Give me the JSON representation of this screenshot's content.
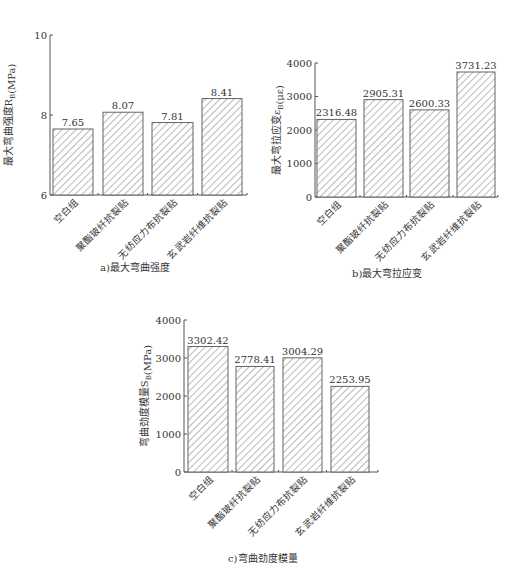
{
  "chart_data": [
    {
      "type": "bar",
      "id": "a",
      "title": "a)最大弯曲强度",
      "ylabel": "最大弯曲强度R_B(MPa)",
      "xlabel": "",
      "categories": [
        "空白组",
        "聚酯玻纤抗裂贴",
        "无纺应力布抗裂贴",
        "玄武岩纤维抗裂贴"
      ],
      "values": [
        7.65,
        8.07,
        7.81,
        8.41
      ],
      "value_labels": [
        "7.65",
        "8.07",
        "7.81",
        "8.41"
      ],
      "ylim": [
        6,
        10
      ],
      "yticks": [
        6,
        8,
        10
      ],
      "grid": false,
      "pattern": "diagonal-hatch"
    },
    {
      "type": "bar",
      "id": "b",
      "title": "b)最大弯拉应变",
      "ylabel": "最大弯拉应变ε_B(με)",
      "xlabel": "",
      "categories": [
        "空白组",
        "聚酯玻纤抗裂贴",
        "无纺应力布抗裂贴",
        "玄武岩纤维抗裂贴"
      ],
      "values": [
        2316.48,
        2905.31,
        2600.33,
        3731.23
      ],
      "value_labels": [
        "2316.48",
        "2905.31",
        "2600.33",
        "3731.23"
      ],
      "ylim": [
        0,
        4000
      ],
      "yticks": [
        0,
        1000,
        2000,
        3000,
        4000
      ],
      "grid": false,
      "pattern": "diagonal-hatch"
    },
    {
      "type": "bar",
      "id": "c",
      "title": "c)弯曲劲度模量",
      "ylabel": "弯曲劲度模量S_B(MPa)",
      "xlabel": "",
      "categories": [
        "空白组",
        "聚酯玻纤抗裂贴",
        "无纺应力布抗裂贴",
        "玄武岩纤维抗裂贴"
      ],
      "values": [
        3302.42,
        2778.41,
        3004.29,
        2253.95
      ],
      "value_labels": [
        "3302.42",
        "2778.41",
        "3004.29",
        "2253.95"
      ],
      "ylim": [
        0,
        4000
      ],
      "yticks": [
        0,
        1000,
        2000,
        3000,
        4000
      ],
      "grid": false,
      "pattern": "diagonal-hatch"
    }
  ],
  "layout": {
    "charts": [
      {
        "x0": 50,
        "x1": 247,
        "ytop": 35,
        "ybot": 195,
        "bars": [
          [
            53,
            93
          ],
          [
            103,
            143
          ],
          [
            152,
            193
          ],
          [
            202,
            242
          ]
        ],
        "caption_x": 100,
        "caption_y": 266,
        "ylabel_x": 12
      },
      {
        "x0": 315,
        "x1": 498,
        "ytop": 63,
        "ybot": 197,
        "bars": [
          [
            317,
            356
          ],
          [
            364,
            403
          ],
          [
            410,
            449
          ],
          [
            457,
            495
          ]
        ],
        "caption_x": 352,
        "caption_y": 272,
        "ylabel_x": 280
      },
      {
        "x0": 184,
        "x1": 378,
        "ytop": 320,
        "ybot": 472,
        "bars": [
          [
            188,
            228
          ],
          [
            236,
            274
          ],
          [
            283,
            322
          ],
          [
            331,
            369
          ]
        ],
        "caption_x": 228,
        "caption_y": 557,
        "ylabel_x": 148
      }
    ],
    "colors": {
      "axis": "#555555",
      "hatch": "#666666",
      "bar_fill": "#ffffff",
      "text": "#333333"
    }
  }
}
